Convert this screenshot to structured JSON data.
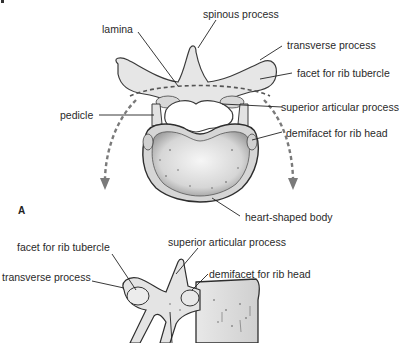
{
  "figure": {
    "panel_a": {
      "letter": "A",
      "view": "superior view of thoracic vertebra",
      "labels": {
        "lamina": "lamina",
        "spinous_process": "spinous process",
        "transverse_process": "transverse process",
        "facet_rib_tubercle": "facet for rib tubercle",
        "pedicle": "pedicle",
        "superior_articular_process": "superior articular process",
        "demifacet_rib_head": "demifacet for rib head",
        "heart_shaped_body": "heart-shaped body"
      }
    },
    "panel_b": {
      "view": "lateral view of thoracic vertebra",
      "labels": {
        "facet_rib_tubercle": "facet for rib tubercle",
        "superior_articular_process": "superior articular process",
        "transverse_process": "transverse process",
        "demifacet_rib_head": "demifacet for rib head"
      }
    },
    "colors": {
      "bone_fill": "#e4e4e4",
      "bone_stroke": "#3a3a3a",
      "arrow": "#7a7a7a",
      "leader_line": "#222222",
      "text": "#2a2a2a"
    }
  }
}
